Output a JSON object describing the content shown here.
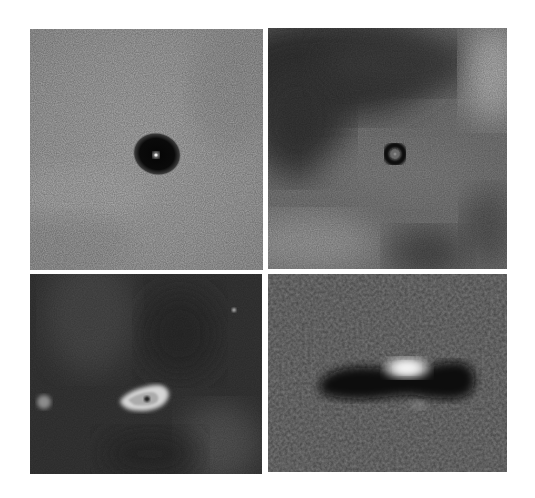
{
  "figure": {
    "layout": "2x2 grid",
    "background": "#ffffff",
    "panels": [
      {
        "id": "top-left",
        "description": "Dark oval silhouette disk with bright central point on light gray nebular background",
        "background_tone": "#a9a9a9",
        "object": {
          "type": "silhouette-disk",
          "center": [
            157,
            154
          ],
          "size": [
            42,
            38
          ],
          "core": "bright point"
        }
      },
      {
        "id": "top-right",
        "description": "Small dark ring silhouette with faint center on mottled gray background, dark region upper-left, bright region upper-right",
        "background_tone": "#7c7c7c",
        "object": {
          "type": "silhouette-ring",
          "center": [
            395,
            154
          ],
          "size": [
            24,
            22
          ]
        }
      },
      {
        "id": "bottom-left",
        "description": "Bright crescent-shaped object with dark inner spot on dark background, faint blob left and small star upper right",
        "background_tone": "#3b3b3b",
        "object": {
          "type": "bright-crescent",
          "center": [
            137,
            400
          ],
          "size": [
            42,
            22
          ]
        },
        "extra_sources": [
          {
            "type": "diffuse-blob",
            "center": [
              44,
              402
            ]
          },
          {
            "type": "point-star",
            "center": [
              234,
              310
            ]
          }
        ]
      },
      {
        "id": "bottom-right",
        "description": "Edge-on dark disk silhouette with bright glow above center on textured gray background",
        "background_tone": "#7b7b7b",
        "object": {
          "type": "edge-on-disk",
          "center": [
            395,
            382
          ],
          "size": [
            150,
            46
          ],
          "glow": [
            407,
            368
          ]
        }
      }
    ]
  }
}
